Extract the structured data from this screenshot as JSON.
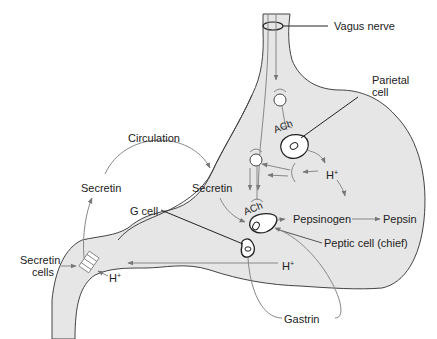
{
  "diagram": {
    "title": "",
    "colors": {
      "stomach_fill": "#e6e6e6",
      "outline": "#444444",
      "arrow": "#808080",
      "leader": "#222222",
      "text": "#222222"
    },
    "labels": {
      "vagus_nerve": "Vagus nerve",
      "parietal_cell_line1": "Parietal",
      "parietal_cell_line2": "cell",
      "circulation": "Circulation",
      "secretin_left": "Secretin",
      "secretin_right": "Secretin",
      "g_cell": "G cell",
      "ach_upper": "ACh",
      "ach_lower": "ACh",
      "h_plus_upper": "H",
      "h_plus_upper_sup": "+",
      "pepsinogen": "Pepsinogen",
      "pepsin": "Pepsin",
      "peptic_cell": "Peptic cell (chief)",
      "h_plus_lower": "H",
      "h_plus_lower_sup": "+",
      "h_plus_duodenum": "H",
      "h_plus_duodenum_sup": "+",
      "secretin_cells_line1": "Secretin",
      "secretin_cells_line2": "cells",
      "gastrin": "Gastrin"
    },
    "nodes": [
      {
        "id": "vagus-nerve",
        "label": "Vagus nerve"
      },
      {
        "id": "parietal-cell",
        "label": "Parietal cell"
      },
      {
        "id": "g-cell",
        "label": "G cell"
      },
      {
        "id": "peptic-cell",
        "label": "Peptic cell (chief)"
      },
      {
        "id": "secretin-cells",
        "label": "Secretin cells"
      }
    ],
    "flows": [
      {
        "from": "Vagus nerve",
        "to": "Parietal cell",
        "via": "ACh"
      },
      {
        "from": "Vagus nerve",
        "to": "Peptic cell (chief)",
        "via": "ACh"
      },
      {
        "from": "Parietal cell",
        "to": "H+"
      },
      {
        "from": "H+",
        "to": "Vagus nerve (inhibitory)"
      },
      {
        "from": "Peptic cell (chief)",
        "to": "Pepsinogen"
      },
      {
        "from": "Pepsinogen",
        "to": "Pepsin"
      },
      {
        "from": "H+",
        "to": "Secretin cells"
      },
      {
        "from": "Secretin cells",
        "to": "Secretin",
        "via": "Circulation"
      },
      {
        "from": "Secretin",
        "to": "Peptic cell (chief)"
      },
      {
        "from": "G cell",
        "to": "Gastrin"
      },
      {
        "from": "Gastrin",
        "to": "Peptic cell (chief)"
      }
    ]
  }
}
